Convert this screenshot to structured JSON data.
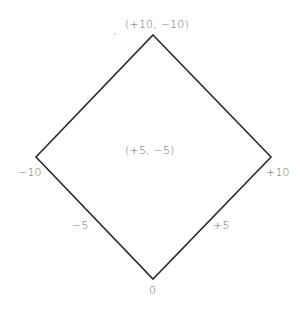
{
  "diagram": {
    "type": "diamond",
    "stroke_color": "#2b2b2b",
    "label_color": "#6a6a6a",
    "vertices": {
      "top": {
        "x": 153,
        "y": 35
      },
      "left": {
        "x": 36,
        "y": 157
      },
      "right": {
        "x": 271,
        "y": 157
      },
      "bottom": {
        "x": 153,
        "y": 279
      }
    },
    "labels": {
      "top": "(+10, −10)",
      "left": "−10",
      "right": "+10",
      "bottom": "0",
      "center": "(+5, −5)",
      "lower_left_edge": "−5",
      "lower_right_edge": "+5"
    }
  }
}
